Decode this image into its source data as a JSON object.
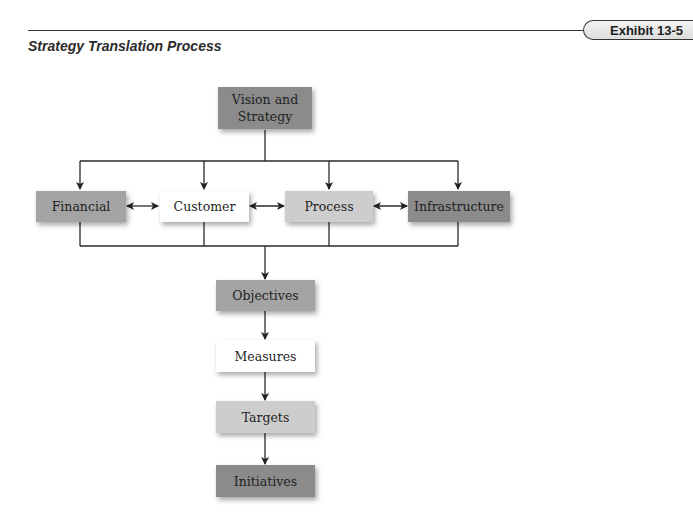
{
  "header": {
    "exhibit_label": "Exhibit 13-5",
    "title": "Strategy Translation Process"
  },
  "diagram": {
    "top": {
      "label": "Vision and Strategy",
      "label_line1": "Vision and",
      "label_line2": "Strategy",
      "shade": "#8b8b8b"
    },
    "perspectives": [
      {
        "label": "Financial",
        "shade": "#a4a4a4"
      },
      {
        "label": "Customer",
        "shade": "#ffffff"
      },
      {
        "label": "Process",
        "shade": "#cdcdcd"
      },
      {
        "label": "Infrastructure",
        "shade": "#8b8b8b"
      }
    ],
    "bidirectional_links": [
      [
        "Financial",
        "Customer"
      ],
      [
        "Customer",
        "Process"
      ],
      [
        "Process",
        "Infrastructure"
      ]
    ],
    "chain": [
      {
        "label": "Objectives",
        "shade": "#a4a4a4"
      },
      {
        "label": "Measures",
        "shade": "#ffffff"
      },
      {
        "label": "Targets",
        "shade": "#cdcdcd"
      },
      {
        "label": "Initiatives",
        "shade": "#8b8b8b"
      }
    ]
  }
}
